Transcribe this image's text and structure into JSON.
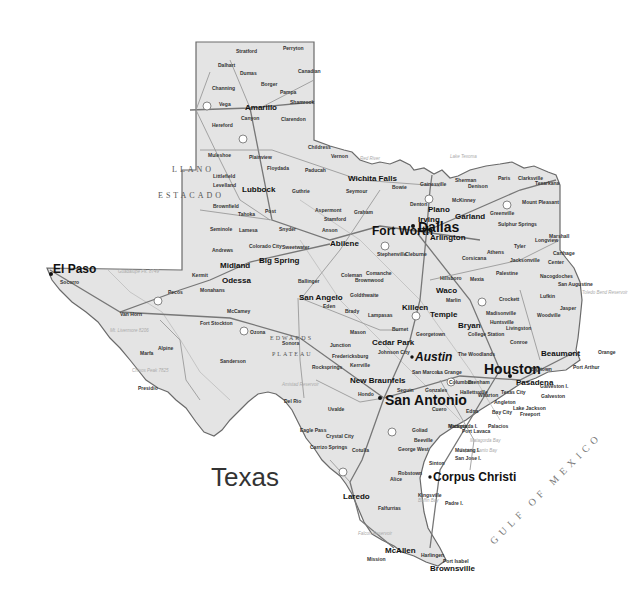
{
  "map": {
    "title": "Texas",
    "colors": {
      "land": "#e4e4e4",
      "border": "#6a6a6a",
      "water": "#ffffff",
      "text": "#111111"
    },
    "region_labels": {
      "llano_1": "LLANO",
      "llano_2": "ESTACADO",
      "edwards_1": "EDWARDS",
      "edwards_2": "PLATEAU",
      "gulf": "GULF OF MEXICO"
    },
    "cities_major": {
      "houston": "Houston",
      "dallas": "Dallas",
      "san_antonio": "San Antonio",
      "austin": "Austin",
      "fort_worth": "Fort Worth",
      "el_paso": "El Paso",
      "corpus_christi": "Corpus Christi"
    },
    "cities_medium": {
      "amarillo": "Amarillo",
      "lubbock": "Lubbock",
      "wichita_falls": "Wichita Falls",
      "abilene": "Abilene",
      "odessa": "Odessa",
      "midland": "Midland",
      "big_spring": "Big Spring",
      "san_angelo": "San Angelo",
      "waco": "Waco",
      "killeen": "Killeen",
      "temple": "Temple",
      "bryan": "Bryan",
      "college_station": "College Station",
      "georgetown": "Georgetown",
      "cedar_park": "Cedar Park",
      "new_braunfels": "New Braunfels",
      "san_marcos": "San Marcos",
      "beaumont": "Beaumont",
      "port_arthur": "Port Arthur",
      "pasadena": "Pasadena",
      "galveston": "Galveston",
      "texas_city": "Texas City",
      "lake_jackson": "Lake Jackson",
      "victoria": "Victoria",
      "laredo": "Laredo",
      "kingsville": "Kingsville",
      "mcallen": "McAllen",
      "brownsville": "Brownsville",
      "harlingen": "Harlingen",
      "mission": "Mission",
      "del_rio": "Del Rio",
      "plano": "Plano",
      "irving": "Irving",
      "garland": "Garland",
      "arlington": "Arlington",
      "denton": "Denton",
      "mckinney": "McKinney",
      "sherman": "Sherman",
      "paris": "Paris",
      "texarkana": "Texarkana",
      "tyler": "Tyler",
      "longview": "Longview",
      "nacogdoches": "Nacogdoches",
      "lufkin": "Lufkin",
      "huntsville": "Huntsville",
      "conroe": "Conroe",
      "the_woodlands": "The Woodlands",
      "cleburne": "Cleburne"
    },
    "cities_small": {
      "stratford": "Stratford",
      "perryton": "Perryton",
      "dalhart": "Dalhart",
      "dumas": "Dumas",
      "borger": "Borger",
      "pampa": "Pampa",
      "canadian": "Canadian",
      "channing": "Channing",
      "vega": "Vega",
      "shamrock": "Shamrock",
      "canyon": "Canyon",
      "clarendon": "Clarendon",
      "hereford": "Hereford",
      "childress": "Childress",
      "muleshoe": "Muleshoe",
      "plainview": "Plainview",
      "floydada": "Floydada",
      "paducah": "Paducah",
      "vernon": "Vernon",
      "littlefield": "Littlefield",
      "levelland": "Levelland",
      "guthrie": "Guthrie",
      "brownfield": "Brownfield",
      "tahoka": "Tahoka",
      "post": "Post",
      "aspermont": "Aspermont",
      "stamford": "Stamford",
      "seminole": "Seminole",
      "lamesa": "Lamesa",
      "snyder": "Snyder",
      "anson": "Anson",
      "andrews": "Andrews",
      "colorado_city": "Colorado City",
      "sweetwater": "Sweetwater",
      "seymour": "Seymour",
      "graham": "Graham",
      "kermit": "Kermit",
      "pecos": "Pecos",
      "monahans": "Monahans",
      "mccamey": "McCamey",
      "van_horn": "Van Horn",
      "fort_stockton": "Fort Stockton",
      "ozona": "Ozona",
      "alpine": "Alpine",
      "marfa": "Marfa",
      "presidio": "Presidio",
      "sanderson": "Sanderson",
      "socorro": "Socorro",
      "ballinger": "Ballinger",
      "coleman": "Coleman",
      "brownwood": "Brownwood",
      "eden": "Eden",
      "brady": "Brady",
      "lampasas": "Lampasas",
      "mason": "Mason",
      "burnet": "Burnet",
      "sonora": "Sonora",
      "junction": "Junction",
      "fredericksburg": "Fredericksburg",
      "kerrville": "Kerrville",
      "rocksprings": "Rocksprings",
      "uvalde": "Uvalde",
      "eagle_pass": "Eagle Pass",
      "crystal_city": "Crystal City",
      "carrizo_springs": "Carrizo Springs",
      "cotulla": "Cotulla",
      "hondo": "Hondo",
      "seguin": "Seguin",
      "gonzales": "Gonzales",
      "hallettsville": "Hallettsville",
      "cuero": "Cuero",
      "goliad": "Goliad",
      "beeville": "Beeville",
      "george_west": "George West",
      "sinton": "Sinton",
      "robstown": "Robstown",
      "alice": "Alice",
      "falfurrias": "Falfurrias",
      "port_lavaca": "Port Lavaca",
      "palacios": "Palacios",
      "edna": "Edna",
      "bay_city": "Bay City",
      "freeport": "Freeport",
      "angleton": "Angleton",
      "wharton": "Wharton",
      "la_grange": "La Grange",
      "columbus": "Columbus",
      "brenham": "Brenham",
      "baytown": "Baytown",
      "orange": "Orange",
      "jasper": "Jasper",
      "woodville": "Woodville",
      "livingston": "Livingston",
      "crockett": "Crockett",
      "palestine": "Palestine",
      "jacksonville": "Jacksonville",
      "athens": "Athens",
      "corsicana": "Corsicana",
      "mexia": "Mexia",
      "marlin": "Marlin",
      "hillsboro": "Hillsboro",
      "stephenville": "Stephenville",
      "comanche": "Comanche",
      "goldthwaite": "Goldthwaite",
      "gainesville": "Gainesville",
      "bowie": "Bowie",
      "greenville": "Greenville",
      "mount_pleasant": "Mount Pleasant",
      "marshall": "Marshall",
      "carthage": "Carthage",
      "center": "Center",
      "san_augustine": "San Augustine",
      "sulphur_springs": "Sulphur Springs",
      "clarksville": "Clarksville",
      "denison": "Denison",
      "port_isabel": "Port Isabel",
      "johnson_city": "Johnson City",
      "madisonville": "Madisonville"
    },
    "islands": {
      "padre": "Padre I.",
      "mustang": "Mustang I.",
      "san_jose": "San Jose I.",
      "matagorda": "Matagorda I.",
      "galveston_i": "Galveston I."
    },
    "water_labels": {
      "red_river": "Red River",
      "lake_texoma": "Lake Texoma",
      "toledo_bend": "Toledo Bend Reservoir",
      "matagorda_bay": "Matagorda Bay",
      "espiritu_santo": "Espiritu Santo Bay",
      "baffin_bay": "Baffin Bay",
      "falcon_res": "Falcon Reservoir",
      "amistad_res": "Amistad Reservoir",
      "pecos_river": "Pecos River"
    },
    "peaks": {
      "guadalupe": "Guadalupe Pk. 8749",
      "livermore": "Mt. Livermore 8206",
      "chisos": "Chisos Peak 7825",
      "emory": "Emory Peak"
    },
    "highway_shields": [
      "40",
      "27",
      "35",
      "20",
      "10",
      "45",
      "37",
      "30",
      "44",
      "69",
      "2"
    ]
  }
}
